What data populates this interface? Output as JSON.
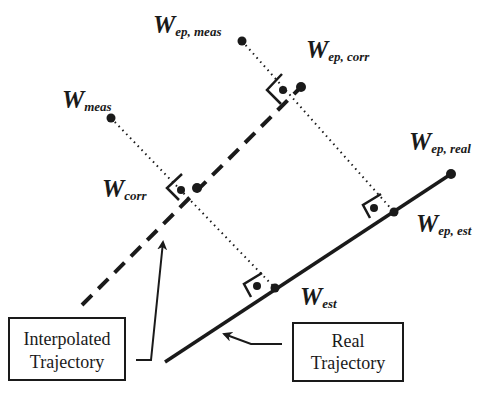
{
  "diagram": {
    "type": "trajectory-correction-geometry",
    "colors": {
      "ink": "#1a1a1a",
      "background": "#ffffff"
    },
    "labels": {
      "w_meas": {
        "main": "W",
        "sub": "meas"
      },
      "w_ep_meas": {
        "main": "W",
        "sub": "ep, meas"
      },
      "w_ep_corr": {
        "main": "W",
        "sub": "ep, corr"
      },
      "w_corr": {
        "main": "W",
        "sub": "corr"
      },
      "w_ep_real": {
        "main": "W",
        "sub": "ep, real"
      },
      "w_ep_est": {
        "main": "W",
        "sub": "ep, est"
      },
      "w_est": {
        "main": "W",
        "sub": "est"
      }
    },
    "boxes": {
      "interpolated": {
        "line1": "Interpolated",
        "line2": "Trajectory"
      },
      "real": {
        "line1": "Real",
        "line2": "Trajectory"
      }
    },
    "lines": {
      "interpolated_trajectory": {
        "style": "dashed",
        "from": [
          82,
          305
        ],
        "to": [
          298,
          90
        ]
      },
      "real_trajectory": {
        "style": "solid",
        "from": [
          165,
          362
        ],
        "to": [
          451,
          174
        ]
      }
    },
    "points": {
      "w_meas": [
        111,
        118
      ],
      "w_ep_meas": [
        242,
        41
      ],
      "w_corr": [
        197,
        188
      ],
      "w_ep_corr": [
        301,
        87
      ],
      "w_ep_real": [
        451,
        174
      ],
      "w_ep_est": [
        394,
        212
      ],
      "w_est": [
        275,
        288
      ]
    }
  }
}
